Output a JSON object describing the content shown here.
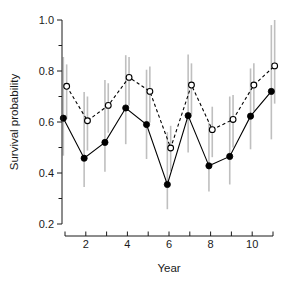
{
  "chart_data": {
    "type": "line",
    "title": "",
    "subtitle": "",
    "xlabel": "Year",
    "ylabel": "Survival probability",
    "x": [
      1,
      2,
      3,
      4,
      5,
      6,
      7,
      8,
      9,
      10,
      11
    ],
    "xlim": [
      0.6,
      11.4
    ],
    "ylim": [
      0.2,
      1.0
    ],
    "xticks": [
      1,
      2,
      3,
      4,
      5,
      6,
      7,
      8,
      9,
      10,
      11
    ],
    "xtick_labels": [
      "",
      "2",
      "",
      "4",
      "",
      "6",
      "",
      "8",
      "",
      "10",
      ""
    ],
    "yticks": [
      0.2,
      0.3,
      0.4,
      0.5,
      0.6,
      0.7,
      0.8,
      0.9,
      1.0
    ],
    "ytick_labels": [
      "0.2",
      "",
      "0.4",
      "",
      "0.6",
      "",
      "0.8",
      "",
      "1.0"
    ],
    "grid": false,
    "legend": "none",
    "series": [
      {
        "name": "solid-filled-circles",
        "marker": "filled-circle",
        "linestyle": "solid",
        "color": "#000000",
        "errorbar_color": "#bfbfbf",
        "x_offset": -0.08,
        "values": [
          0.615,
          0.458,
          0.52,
          0.655,
          0.59,
          0.355,
          0.625,
          0.428,
          0.465,
          0.623,
          0.72
        ],
        "error_low": [
          0.468,
          0.345,
          0.405,
          0.513,
          0.455,
          0.258,
          0.48,
          0.327,
          0.355,
          0.493,
          0.532
        ],
        "error_high": [
          0.855,
          0.718,
          0.765,
          0.862,
          0.805,
          0.56,
          0.865,
          0.597,
          0.7,
          0.81,
          0.98
        ]
      },
      {
        "name": "dashed-open-circles",
        "marker": "open-circle",
        "linestyle": "dashed",
        "color": "#000000",
        "errorbar_color": "#bfbfbf",
        "x_offset": 0.08,
        "values": [
          0.74,
          0.605,
          0.665,
          0.775,
          0.72,
          0.498,
          0.745,
          0.57,
          0.61,
          0.745,
          0.82
        ],
        "error_low": [
          0.612,
          0.488,
          0.558,
          0.665,
          0.598,
          0.408,
          0.63,
          0.462,
          0.5,
          0.642,
          0.672
        ],
        "error_high": [
          0.826,
          0.7,
          0.752,
          0.855,
          0.818,
          0.585,
          0.83,
          0.66,
          0.706,
          0.83,
          1.0
        ]
      }
    ]
  }
}
